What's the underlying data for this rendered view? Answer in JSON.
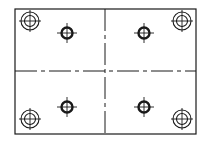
{
  "drawing": {
    "type": "plate-with-holes",
    "canvas": {
      "width": 209,
      "height": 143,
      "background": "#ffffff"
    },
    "colors": {
      "outline": "#1a1a1a",
      "centerline": "#1a1a1a"
    },
    "plate": {
      "x": 15,
      "y": 9,
      "width": 181,
      "height": 125,
      "stroke_width": 1.2
    },
    "centerlines": {
      "horizontal": {
        "y": 71,
        "x1": 15,
        "x2": 196,
        "dash": "22 4 4 4"
      },
      "vertical": {
        "x": 105,
        "y1": 9,
        "y2": 134,
        "dash": "22 4 4 4"
      }
    },
    "counterbored_holes": [
      {
        "id": "top-left",
        "cx": 30,
        "cy": 21,
        "r_outer": 9,
        "r_inner": 5.5,
        "cross": 11
      },
      {
        "id": "top-right",
        "cx": 182,
        "cy": 21,
        "r_outer": 9,
        "r_inner": 5.5,
        "cross": 11
      },
      {
        "id": "bottom-left",
        "cx": 30,
        "cy": 119,
        "r_outer": 9,
        "r_inner": 5.5,
        "cross": 11
      },
      {
        "id": "bottom-right",
        "cx": 182,
        "cy": 119,
        "r_outer": 9,
        "r_inner": 5.5,
        "cross": 11
      }
    ],
    "small_holes": [
      {
        "id": "top-left",
        "cx": 67,
        "cy": 33,
        "r": 5.5,
        "stroke_width": 2.4,
        "cross": 10
      },
      {
        "id": "top-right",
        "cx": 144,
        "cy": 33,
        "r": 5.5,
        "stroke_width": 2.4,
        "cross": 10
      },
      {
        "id": "bottom-left",
        "cx": 67,
        "cy": 107,
        "r": 5.5,
        "stroke_width": 2.4,
        "cross": 10
      },
      {
        "id": "bottom-right",
        "cx": 144,
        "cy": 107,
        "r": 5.5,
        "stroke_width": 2.4,
        "cross": 10
      }
    ]
  }
}
